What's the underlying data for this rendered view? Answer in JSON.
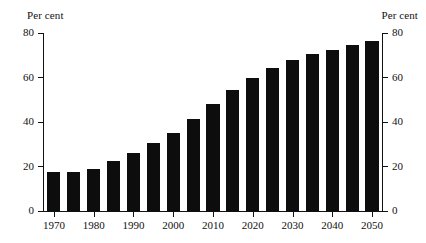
{
  "axes": {
    "unit_label_left": "Per cent",
    "unit_label_right": "Per cent",
    "y_ticks": [
      "0",
      "20",
      "40",
      "60",
      "80"
    ],
    "x_ticks": [
      "1970",
      "1980",
      "1990",
      "2000",
      "2010",
      "2020",
      "2030",
      "2040",
      "2050"
    ]
  },
  "colors": {
    "bar": "#0d0d0d",
    "axis": "#111111",
    "background": "#ffffff"
  },
  "chart_data": {
    "type": "bar",
    "title": "",
    "subtitle": "",
    "xlabel": "",
    "ylabel": "Per cent",
    "ylim": [
      0,
      80
    ],
    "ytick_values": [
      0,
      20,
      40,
      60,
      80
    ],
    "xtick_values": [
      1970,
      1980,
      1990,
      2000,
      2010,
      2020,
      2030,
      2040,
      2050
    ],
    "grid": false,
    "legend": false,
    "legend_position": "none",
    "annotations": [],
    "categories": [
      "1970",
      "1975",
      "1980",
      "1985",
      "1990",
      "1995",
      "2000",
      "2005",
      "2010",
      "2015",
      "2020",
      "2025",
      "2030",
      "2035",
      "2040",
      "2045",
      "2050"
    ],
    "values": [
      17.5,
      17.5,
      19,
      22.5,
      26,
      30.5,
      35,
      41.5,
      48,
      54.5,
      60,
      64.5,
      68,
      70.5,
      72.5,
      74.5,
      76.5
    ],
    "series": [
      {
        "name": "Per cent",
        "values": [
          17.5,
          17.5,
          19,
          22.5,
          26,
          30.5,
          35,
          41.5,
          48,
          54.5,
          60,
          64.5,
          68,
          70.5,
          72.5,
          74.5,
          76.5
        ]
      }
    ]
  }
}
